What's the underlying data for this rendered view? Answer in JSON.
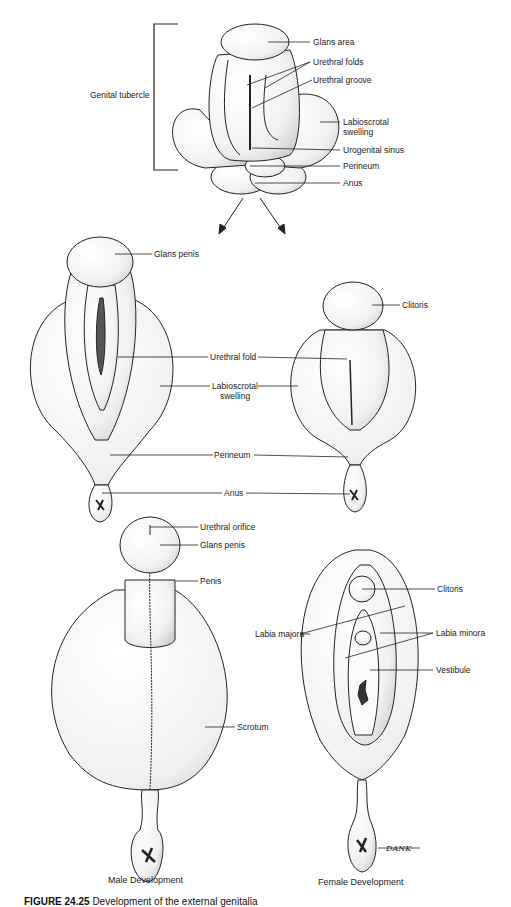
{
  "figure": {
    "caption_number": "FIGURE 24.25",
    "caption_text": "Development of the external genitalia",
    "artist_signature": "DANK"
  },
  "indifferent_stage": {
    "bracket_label": "Genital tubercle",
    "labels": [
      "Glans area",
      "Urethral folds",
      "Urethral groove",
      "Labioscrotal swelling",
      "Urogenital sinus",
      "Perineum",
      "Anus"
    ]
  },
  "intermediate_stage": {
    "male_labels": [
      "Glans penis"
    ],
    "shared_labels": [
      "Urethral fold",
      "Labioscrotal swelling",
      "Perineum",
      "Anus"
    ],
    "female_labels": [
      "Clitoris"
    ]
  },
  "final_stage": {
    "male": {
      "title": "Male Development",
      "labels": [
        "Urethral orifice",
        "Glans penis",
        "Penis",
        "Scrotum"
      ]
    },
    "female": {
      "title": "Female Development",
      "labels": [
        "Clitoris",
        "Labia majora",
        "Labia minora",
        "Vestibule"
      ]
    }
  }
}
